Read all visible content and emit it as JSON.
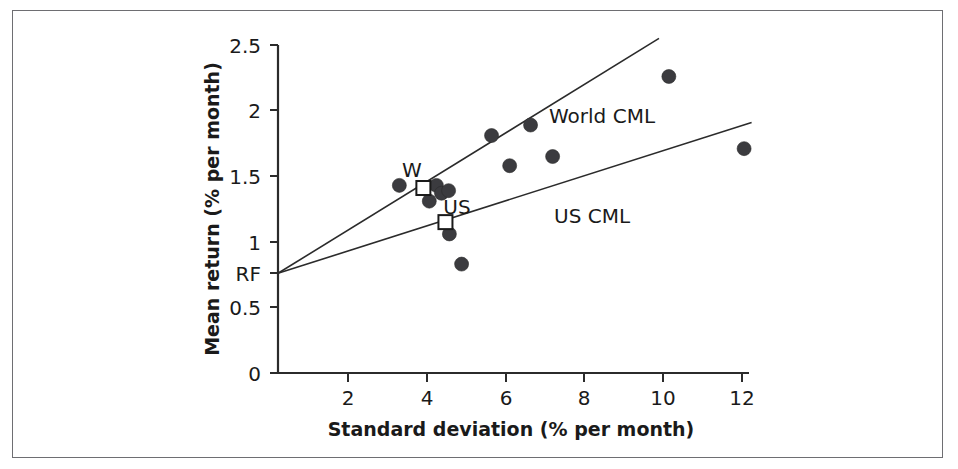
{
  "figure": {
    "frame_border_color": "#6e6e72",
    "background": "#ffffff"
  },
  "chart_data": {
    "type": "scatter",
    "title": "",
    "xlabel": "Standard deviation (% per month)",
    "ylabel": "Mean return (% per month)",
    "xlim": [
      0,
      12.6
    ],
    "ylim": [
      0,
      2.5
    ],
    "xticks": [
      2,
      4,
      6,
      8,
      10,
      12
    ],
    "xtick_labels": [
      "2",
      "4",
      "6",
      "8",
      "10",
      "12"
    ],
    "yticks": [
      0,
      0.5,
      1,
      1.5,
      2,
      2.5
    ],
    "ytick_labels": [
      "0",
      "0.5",
      "1",
      "1.5",
      "2",
      "2.5"
    ],
    "grid": false,
    "legend_position": "inline-annotations",
    "risk_free_label": "RF",
    "risk_free_rate": 0.76,
    "series": [
      {
        "name": "Country portfolios",
        "marker": "filled-circle",
        "color": "#3b3b3f",
        "points": [
          {
            "x": 3.08,
            "y": 1.43
          },
          {
            "x": 4.02,
            "y": 1.43
          },
          {
            "x": 3.84,
            "y": 1.31
          },
          {
            "x": 4.15,
            "y": 1.37
          },
          {
            "x": 4.33,
            "y": 1.39
          },
          {
            "x": 4.35,
            "y": 1.06
          },
          {
            "x": 4.66,
            "y": 0.83
          },
          {
            "x": 5.42,
            "y": 1.81
          },
          {
            "x": 5.88,
            "y": 1.58
          },
          {
            "x": 6.41,
            "y": 1.89
          },
          {
            "x": 6.97,
            "y": 1.65
          },
          {
            "x": 9.92,
            "y": 2.26
          },
          {
            "x": 11.83,
            "y": 1.71
          }
        ]
      },
      {
        "name": "Index portfolios",
        "marker": "open-square",
        "color": "#1a1a1a",
        "points": [
          {
            "x": 3.69,
            "y": 1.41,
            "label": "W"
          },
          {
            "x": 4.25,
            "y": 1.15,
            "label": "US"
          }
        ]
      }
    ],
    "lines": [
      {
        "name": "World CML",
        "label": "World CML",
        "x0": 0.0,
        "y0": 0.76,
        "x1": 9.67,
        "y1": 2.55,
        "label_x": 6.2,
        "label_y": 2.02
      },
      {
        "name": "US CML",
        "label": "US CML",
        "x0": 0.0,
        "y0": 0.76,
        "x1": 12.02,
        "y1": 1.91,
        "label_x": 6.6,
        "label_y": 1.27
      }
    ],
    "annotations": [
      {
        "text": "W",
        "x": 3.55,
        "y": 1.58
      },
      {
        "text": "US",
        "x": 4.18,
        "y": 1.3
      },
      {
        "text": "RF",
        "x": -0.62,
        "y": 0.76
      },
      {
        "text": "World CML",
        "x": 6.2,
        "y": 2.02
      },
      {
        "text": "US CML",
        "x": 6.6,
        "y": 1.27
      }
    ]
  }
}
